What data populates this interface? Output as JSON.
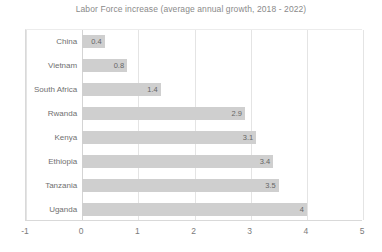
{
  "chart_data": {
    "type": "bar",
    "orientation": "horizontal",
    "title": "Labor Force increase (average annual growth, 2018 - 2022)",
    "xlabel": "",
    "ylabel": "",
    "categories": [
      "China",
      "Vietnam",
      "South Africa",
      "Rwanda",
      "Kenya",
      "Ethiopia",
      "Tanzania",
      "Uganda"
    ],
    "values": [
      0.4,
      0.8,
      1.4,
      2.9,
      3.1,
      3.4,
      3.5,
      4
    ],
    "value_labels": [
      "0.4",
      "0.8",
      "1.4",
      "2.9",
      "3.1",
      "3.4",
      "3.5",
      "4"
    ],
    "xlim": [
      -1,
      5
    ],
    "xticks": [
      -1,
      0,
      1,
      2,
      3,
      4,
      5
    ],
    "xtick_labels": [
      "-1",
      "0",
      "1",
      "2",
      "3",
      "4",
      "5"
    ],
    "grid": true,
    "grid_axis": "x",
    "legend": false,
    "bar_color": "#cfcfcf",
    "title_color": "#8a8a8a",
    "label_color": "#6f6f6f",
    "value_label_color": "#666666",
    "gridline_color": "#e4e4e4",
    "axis_color": "#d9d9d9",
    "background_color": "#ffffff"
  }
}
